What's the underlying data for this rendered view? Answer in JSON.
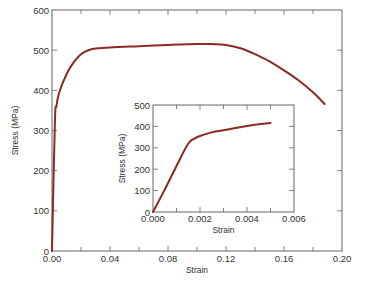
{
  "colors": {
    "curve": "#8b2a24",
    "axis": "#666666",
    "text": "#333333"
  },
  "chart_data": [
    {
      "type": "line",
      "name": "main",
      "title": "",
      "xlabel": "Strain",
      "ylabel": "Stress (MPa)",
      "xlim": [
        0,
        0.2
      ],
      "ylim": [
        0,
        600
      ],
      "xticks": [
        "0.00",
        "0.04",
        "0.08",
        "0.12",
        "0.16",
        "0.20"
      ],
      "yticks": [
        "0",
        "100",
        "200",
        "300",
        "400",
        "500",
        "600"
      ],
      "grid": false,
      "series": [
        {
          "name": "stress-strain",
          "x": [
            0.0,
            0.002,
            0.003,
            0.005,
            0.01,
            0.015,
            0.02,
            0.025,
            0.03,
            0.04,
            0.06,
            0.08,
            0.1,
            0.11,
            0.12,
            0.13,
            0.14,
            0.15,
            0.16,
            0.17,
            0.18,
            0.188
          ],
          "y": [
            0,
            320,
            360,
            395,
            440,
            470,
            490,
            500,
            504,
            507,
            510,
            513,
            515,
            515,
            513,
            505,
            490,
            472,
            450,
            425,
            395,
            366
          ]
        }
      ]
    },
    {
      "type": "line",
      "name": "inset",
      "title": "",
      "xlabel": "Strain",
      "ylabel": "Stress (MPa)",
      "xlim": [
        0,
        0.006
      ],
      "ylim": [
        0,
        500
      ],
      "xticks": [
        "0.000",
        "0.002",
        "0.004",
        "0.006"
      ],
      "yticks": [
        "0",
        "100",
        "200",
        "300",
        "400",
        "500"
      ],
      "grid": false,
      "series": [
        {
          "name": "elastic-region",
          "x": [
            0.0,
            0.0005,
            0.001,
            0.0015,
            0.0018,
            0.002,
            0.0025,
            0.003,
            0.0035,
            0.004,
            0.0045,
            0.005
          ],
          "y": [
            0,
            105,
            215,
            320,
            345,
            355,
            372,
            382,
            392,
            402,
            410,
            416
          ]
        }
      ]
    }
  ]
}
